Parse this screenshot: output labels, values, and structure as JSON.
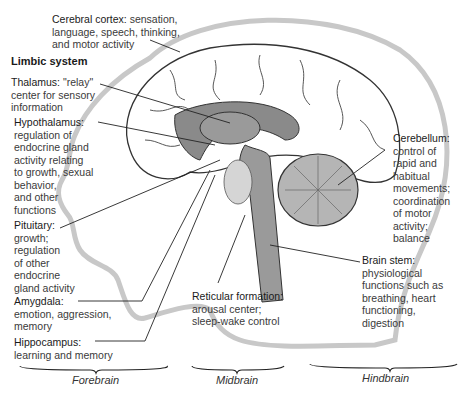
{
  "diagram": {
    "section_header": "Limbic system",
    "labels": {
      "cerebral_cortex": {
        "title": "Cerebral cortex:",
        "lines": [
          "sensation,",
          "language, speech, thinking,",
          "and motor activity"
        ]
      },
      "thalamus": {
        "title": "Thalamus:",
        "lines": [
          "\"relay\"",
          "center for sensory",
          "information"
        ]
      },
      "hypothalamus": {
        "title": "Hypothalamus:",
        "lines": [
          "regulation of",
          "endocrine gland",
          "activity relating",
          "to growth, sexual",
          "behavior,",
          "and other",
          "functions"
        ]
      },
      "pituitary": {
        "title": "Pituitary:",
        "lines": [
          "growth;",
          "regulation",
          "of other",
          "endocrine",
          "gland activity"
        ]
      },
      "amygdala": {
        "title": "Amygdala:",
        "lines": [
          "emotion, aggression,",
          "memory"
        ]
      },
      "hippocampus": {
        "title": "Hippocampus:",
        "lines": [
          "learning and memory"
        ]
      },
      "reticular_formation": {
        "title": "Reticular formation:",
        "lines": [
          "arousal center;",
          "sleep-wake control"
        ]
      },
      "cerebellum": {
        "title": "Cerebellum:",
        "lines": [
          "control of",
          "rapid and",
          "habitual",
          "movements;",
          "coordination",
          "of motor",
          "activity;",
          "balance"
        ]
      },
      "brain_stem": {
        "title": "Brain stem:",
        "lines": [
          "physiological",
          "functions such as",
          "breathing, heart",
          "functioning,",
          "digestion"
        ]
      }
    },
    "regions": {
      "forebrain": "Forebrain",
      "midbrain": "Midbrain",
      "hindbrain": "Hindbrain"
    },
    "colors": {
      "limbic_fill": "#8a8a8a",
      "stem_fill": "#9a9a9a",
      "cerebellum_fill": "#b5b5b5",
      "head_outline": "#c8c8c8",
      "line": "#222222"
    }
  }
}
